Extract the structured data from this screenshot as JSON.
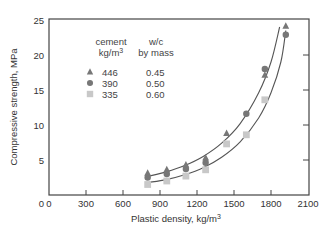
{
  "chart_data": {
    "type": "scatter",
    "title": "",
    "xlabel": "Plastic density, kg/m",
    "xlabel_sup": "3",
    "ylabel": "Compressive strength, MPa",
    "xlim": [
      0,
      2100
    ],
    "ylim": [
      0,
      25
    ],
    "xticks": [
      0,
      300,
      600,
      900,
      1200,
      1500,
      1800,
      2100
    ],
    "yticks": [
      5,
      10,
      15,
      20,
      25
    ],
    "y_zero_label": "0",
    "right_axis_ticks": [
      5,
      10,
      15,
      20
    ],
    "grid": false,
    "legend": {
      "position": "upper-left inside",
      "col1_header_line1": "cement",
      "col1_header_line2": "kg/m",
      "col1_header_sup": "3",
      "col2_header_line1": "w/c",
      "col2_header_line2": "by mass",
      "entries": [
        {
          "marker": "triangle",
          "cement": "446",
          "wc": "0.45"
        },
        {
          "marker": "circle",
          "cement": "390",
          "wc": "0.50"
        },
        {
          "marker": "square",
          "cement": "335",
          "wc": "0.60"
        }
      ]
    },
    "series": [
      {
        "name": "446 kg/m3 cement, w/c 0.45",
        "marker": "triangle",
        "color": "#777777",
        "points": [
          [
            800,
            3.1
          ],
          [
            955,
            3.6
          ],
          [
            1110,
            4.3
          ],
          [
            1270,
            5.3
          ],
          [
            1440,
            8.8
          ],
          [
            1750,
            17.1
          ],
          [
            1920,
            24.1
          ]
        ]
      },
      {
        "name": "390 kg/m3 cement, w/c 0.50",
        "marker": "circle",
        "color": "#777777",
        "points": [
          [
            800,
            2.5
          ],
          [
            955,
            3.0
          ],
          [
            1110,
            3.7
          ],
          [
            1270,
            4.6
          ],
          [
            1600,
            11.6
          ],
          [
            1750,
            18.0
          ],
          [
            1920,
            22.9
          ]
        ]
      },
      {
        "name": "335 kg/m3 cement, w/c 0.60",
        "marker": "square",
        "color": "#c8c8c8",
        "points": [
          [
            800,
            1.5
          ],
          [
            955,
            2.0
          ],
          [
            1110,
            2.7
          ],
          [
            1270,
            3.6
          ],
          [
            1440,
            7.3
          ],
          [
            1600,
            8.6
          ],
          [
            1750,
            13.6
          ]
        ]
      }
    ],
    "fit_curves": [
      {
        "name": "upper fit",
        "color": "#555555",
        "points": [
          [
            810,
            2.7
          ],
          [
            950,
            3.3
          ],
          [
            1100,
            4.2
          ],
          [
            1250,
            5.5
          ],
          [
            1400,
            7.4
          ],
          [
            1550,
            10.2
          ],
          [
            1700,
            14.6
          ],
          [
            1800,
            19.0
          ],
          [
            1870,
            24.0
          ]
        ]
      },
      {
        "name": "lower fit",
        "color": "#555555",
        "points": [
          [
            810,
            1.8
          ],
          [
            950,
            2.2
          ],
          [
            1100,
            2.9
          ],
          [
            1250,
            3.9
          ],
          [
            1400,
            5.4
          ],
          [
            1550,
            7.6
          ],
          [
            1700,
            11.0
          ],
          [
            1800,
            14.6
          ],
          [
            1880,
            19.0
          ],
          [
            1920,
            23.5
          ]
        ]
      }
    ]
  },
  "colors": {
    "axis": "#444444",
    "dark_marker": "#777777",
    "light_marker": "#c8c8c8",
    "curve": "#555555"
  }
}
